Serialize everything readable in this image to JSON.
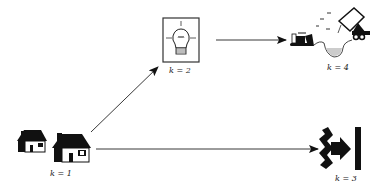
{
  "diagram": {
    "nodes": [
      {
        "id": "k1",
        "label": "k = 1",
        "icon": "houses-icon"
      },
      {
        "id": "k2",
        "label": "k = 2",
        "icon": "lightbulb-icon"
      },
      {
        "id": "k3",
        "label": "k = 3",
        "icon": "barrier-arrow-icon"
      },
      {
        "id": "k4",
        "label": "k = 4",
        "icon": "bulldozer-truck-pit-icon"
      }
    ],
    "edges": [
      {
        "from": "k1",
        "to": "k2"
      },
      {
        "from": "k2",
        "to": "k4"
      },
      {
        "from": "k1",
        "to": "k3"
      }
    ]
  }
}
